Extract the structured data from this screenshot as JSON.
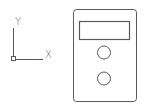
{
  "canvas": {
    "background": "#ffffff",
    "stroke_color": "#5a5a5a"
  },
  "ucs_icon": {
    "x_label": "X",
    "y_label": "Y"
  },
  "device": {
    "outer_body": {
      "shape": "rounded-rectangle"
    },
    "display": {
      "shape": "rectangle"
    },
    "buttons": [
      {
        "shape": "circle"
      },
      {
        "shape": "circle"
      }
    ]
  }
}
